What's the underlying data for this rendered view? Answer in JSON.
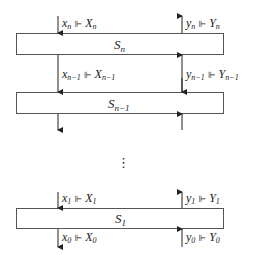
{
  "diagram": {
    "type": "stage-chain",
    "symbol": "⊩",
    "stages": [
      {
        "id": "Sn",
        "base": "S",
        "sub": "n",
        "top": 33,
        "bottom": 54
      },
      {
        "id": "Sn-1",
        "base": "S",
        "sub": "n−1",
        "top": 92,
        "bottom": 113
      },
      {
        "id": "S1",
        "base": "S",
        "sub": "1",
        "top": 208,
        "bottom": 228
      }
    ],
    "labels": {
      "xn": {
        "var": "x",
        "sub": "n",
        "set": "X",
        "setsub": "n"
      },
      "yn": {
        "var": "y",
        "sub": "n",
        "set": "Y",
        "setsub": "n"
      },
      "xn1": {
        "var": "x",
        "sub": "n−1",
        "set": "X",
        "setsub": "n−1"
      },
      "yn1": {
        "var": "y",
        "sub": "n−1",
        "set": "Y",
        "setsub": "n−1"
      },
      "x1": {
        "var": "x",
        "sub": "1",
        "set": "X",
        "setsub": "1"
      },
      "y1": {
        "var": "y",
        "sub": "1",
        "set": "Y",
        "setsub": "1"
      },
      "x0": {
        "var": "x",
        "sub": "0",
        "set": "X",
        "setsub": "0"
      },
      "y0": {
        "var": "y",
        "sub": "0",
        "set": "Y",
        "setsub": "0"
      }
    },
    "ellipsis": "⋮",
    "colors": {
      "stroke": "#333333",
      "text": "#222222",
      "background": "#ffffff"
    }
  }
}
